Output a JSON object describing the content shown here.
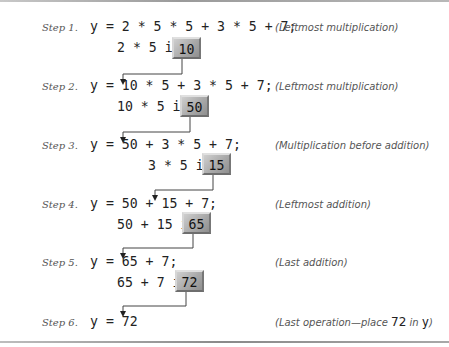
{
  "steps": [
    {
      "label": "Step 1.",
      "expr": "y = 2 * 5 * 5 + 3 * 5 + 7;",
      "sub_prefix": "2 * 5 is ",
      "result": "10",
      "note": "(Leftmost multiplication)"
    },
    {
      "label": "Step 2.",
      "expr": "y = 10 * 5 + 3 * 5 + 7;",
      "sub_prefix": "10 * 5 is ",
      "result": "50",
      "note": "(Leftmost multiplication)"
    },
    {
      "label": "Step 3.",
      "expr": "y = 50 + 3 * 5 + 7;",
      "sub_prefix": "3 * 5 is ",
      "result": "15",
      "note": "(Multiplication before addition)"
    },
    {
      "label": "Step 4.",
      "expr": "y = 50 + 15 + 7;",
      "sub_prefix": "50 + 15 is ",
      "result": "65",
      "note": "(Leftmost addition)"
    },
    {
      "label": "Step 5.",
      "expr": "y = 65 + 7;",
      "sub_prefix": "65 + 7 is ",
      "result": "72",
      "note": "(Last addition)"
    },
    {
      "label": "Step 6.",
      "expr": "y = 72",
      "note_prefix": "(Last operation—place ",
      "note_value": "72",
      "note_mid": " in ",
      "note_var": "y",
      "note_suffix": ")"
    }
  ],
  "colors": {
    "box_fill": "#a9a9a9",
    "text": "#222222",
    "label": "#555555",
    "rule": "#9a9a9a"
  }
}
